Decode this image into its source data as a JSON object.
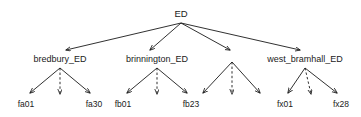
{
  "diagram": {
    "kind": "hierarchy-tree",
    "background_color": "#ffffff",
    "line_color": "#1a1a1a",
    "text_color": "#1a1a1a",
    "root": {
      "label": "ED",
      "x": 181,
      "y": 14
    },
    "level2": [
      {
        "id": "bredbury",
        "label": "bredbury_ED",
        "x": 60,
        "y": 60,
        "labeled": true
      },
      {
        "id": "brinnington",
        "label": "brinnington_ED",
        "x": 157,
        "y": 60,
        "labeled": true
      },
      {
        "id": "elided",
        "label": "",
        "x": 232,
        "y": 60,
        "labeled": false
      },
      {
        "id": "west_bramhall",
        "label": "west_bramhall_ED",
        "x": 305,
        "y": 60,
        "labeled": true
      }
    ],
    "level3": [
      {
        "parent": "bredbury",
        "label": "fa01",
        "x": 26,
        "y": 104,
        "edge": "solid"
      },
      {
        "parent": "bredbury",
        "label": "",
        "x": 60,
        "y": 104,
        "edge": "dashed"
      },
      {
        "parent": "bredbury",
        "label": "fa30",
        "x": 94,
        "y": 104,
        "edge": "solid"
      },
      {
        "parent": "brinnington",
        "label": "fb01",
        "x": 123,
        "y": 104,
        "edge": "solid"
      },
      {
        "parent": "brinnington",
        "label": "",
        "x": 157,
        "y": 104,
        "edge": "dashed"
      },
      {
        "parent": "brinnington",
        "label": "fb23",
        "x": 191,
        "y": 104,
        "edge": "solid"
      },
      {
        "parent": "elided",
        "label": "",
        "x": 200,
        "y": 104,
        "edge": "solid"
      },
      {
        "parent": "elided",
        "label": "",
        "x": 232,
        "y": 104,
        "edge": "dashed"
      },
      {
        "parent": "elided",
        "label": "",
        "x": 262,
        "y": 104,
        "edge": "solid"
      },
      {
        "parent": "west_bramhall",
        "label": "fx01",
        "x": 285,
        "y": 104,
        "edge": "solid"
      },
      {
        "parent": "west_bramhall",
        "label": "",
        "x": 313,
        "y": 104,
        "edge": "dashed"
      },
      {
        "parent": "west_bramhall",
        "label": "fx28",
        "x": 341,
        "y": 104,
        "edge": "solid"
      }
    ]
  }
}
